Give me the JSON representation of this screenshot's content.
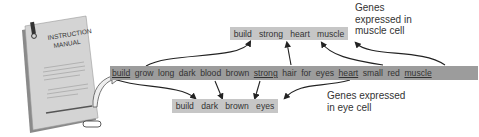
{
  "manual": {
    "title_line1": "INSTRUCTION",
    "title_line2": "MANUAL"
  },
  "main_sequence": {
    "words": [
      {
        "text": "build",
        "underlined": true
      },
      {
        "text": "grow",
        "underlined": false
      },
      {
        "text": "long",
        "underlined": false
      },
      {
        "text": "dark",
        "underlined": false
      },
      {
        "text": "blood",
        "underlined": false
      },
      {
        "text": "brown",
        "underlined": false
      },
      {
        "text": "strong",
        "underlined": true
      },
      {
        "text": "hair",
        "underlined": false
      },
      {
        "text": "for",
        "underlined": false
      },
      {
        "text": "eyes",
        "underlined": false
      },
      {
        "text": "heart",
        "underlined": true
      },
      {
        "text": "small",
        "underlined": false
      },
      {
        "text": "red",
        "underlined": false
      },
      {
        "text": "muscle",
        "underlined": true
      }
    ]
  },
  "muscle_cell": {
    "words": [
      "build",
      "strong",
      "heart",
      "muscle"
    ],
    "label_line1": "Genes",
    "label_line2": "expressed in",
    "label_line3": "muscle cell"
  },
  "eye_cell": {
    "words": [
      "build",
      "dark",
      "brown",
      "eyes"
    ],
    "label_line1": "Genes expressed",
    "label_line2": "in eye cell"
  },
  "colors": {
    "main_bar": "#9c9c9c",
    "subset_bar": "#c6c6c6",
    "arrow": "#222222"
  }
}
